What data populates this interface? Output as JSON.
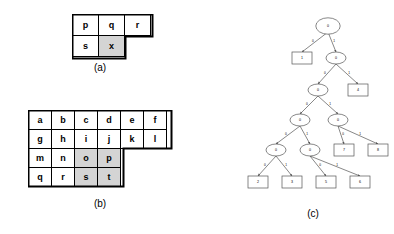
{
  "figures": {
    "a": {
      "caption": "(a)",
      "rows": [
        [
          {
            "label": "p",
            "shaded": false
          },
          {
            "label": "q",
            "shaded": false
          },
          {
            "label": "r",
            "shaded": false
          }
        ],
        [
          {
            "label": "s",
            "shaded": false
          },
          {
            "label": "x",
            "shaded": true
          },
          {
            "label": "",
            "shaded": false,
            "blank": true
          }
        ]
      ]
    },
    "b": {
      "caption": "(b)",
      "rows": [
        [
          {
            "label": "a",
            "shaded": false
          },
          {
            "label": "b",
            "shaded": false
          },
          {
            "label": "c",
            "shaded": false
          },
          {
            "label": "d",
            "shaded": false
          },
          {
            "label": "e",
            "shaded": false
          },
          {
            "label": "f",
            "shaded": false
          }
        ],
        [
          {
            "label": "g",
            "shaded": false
          },
          {
            "label": "h",
            "shaded": false
          },
          {
            "label": "i",
            "shaded": false
          },
          {
            "label": "j",
            "shaded": false
          },
          {
            "label": "k",
            "shaded": false
          },
          {
            "label": "l",
            "shaded": false
          }
        ],
        [
          {
            "label": "m",
            "shaded": false
          },
          {
            "label": "n",
            "shaded": false
          },
          {
            "label": "o",
            "shaded": true
          },
          {
            "label": "p",
            "shaded": true
          },
          {
            "label": "",
            "shaded": false,
            "blank": true
          },
          {
            "label": "",
            "shaded": false,
            "blank": true
          }
        ],
        [
          {
            "label": "q",
            "shaded": false
          },
          {
            "label": "r",
            "shaded": false
          },
          {
            "label": "s",
            "shaded": true
          },
          {
            "label": "t",
            "shaded": true
          },
          {
            "label": "",
            "shaded": false,
            "blank": true
          },
          {
            "label": "",
            "shaded": false,
            "blank": true
          }
        ]
      ]
    },
    "c": {
      "caption": "(c)",
      "nodes": [
        {
          "id": "n0",
          "label": "0",
          "shape": "doubleellipse",
          "x": 96,
          "y": 18
        },
        {
          "id": "n1",
          "label": "1",
          "shape": "rect",
          "x": 70,
          "y": 50
        },
        {
          "id": "n2",
          "label": "0",
          "shape": "ellipse",
          "x": 104,
          "y": 50
        },
        {
          "id": "n3",
          "label": "0",
          "shape": "ellipse",
          "x": 86,
          "y": 82
        },
        {
          "id": "n4",
          "label": "4",
          "shape": "rect",
          "x": 126,
          "y": 82
        },
        {
          "id": "n5",
          "label": "0",
          "shape": "ellipse",
          "x": 68,
          "y": 112
        },
        {
          "id": "n6",
          "label": "0",
          "shape": "ellipse",
          "x": 106,
          "y": 112
        },
        {
          "id": "n7",
          "label": "0",
          "shape": "ellipse",
          "x": 44,
          "y": 142
        },
        {
          "id": "n8",
          "label": "0",
          "shape": "ellipse",
          "x": 78,
          "y": 142
        },
        {
          "id": "n9",
          "label": "7",
          "shape": "rect",
          "x": 112,
          "y": 142
        },
        {
          "id": "n10",
          "label": "8",
          "shape": "rect",
          "x": 146,
          "y": 142
        },
        {
          "id": "n11",
          "label": "2",
          "shape": "rect",
          "x": 26,
          "y": 174
        },
        {
          "id": "n12",
          "label": "3",
          "shape": "rect",
          "x": 60,
          "y": 174
        },
        {
          "id": "n13",
          "label": "5",
          "shape": "rect",
          "x": 94,
          "y": 174
        },
        {
          "id": "n14",
          "label": "6",
          "shape": "rect",
          "x": 128,
          "y": 174
        }
      ],
      "edges": [
        {
          "from": "n0",
          "to": "n1",
          "label": "0"
        },
        {
          "from": "n0",
          "to": "n2",
          "label": "1"
        },
        {
          "from": "n2",
          "to": "n3",
          "label": "0"
        },
        {
          "from": "n2",
          "to": "n4",
          "label": "1"
        },
        {
          "from": "n3",
          "to": "n5",
          "label": "0"
        },
        {
          "from": "n3",
          "to": "n6",
          "label": "1"
        },
        {
          "from": "n5",
          "to": "n7",
          "label": "0"
        },
        {
          "from": "n5",
          "to": "n8",
          "label": "1"
        },
        {
          "from": "n6",
          "to": "n9",
          "label": "0"
        },
        {
          "from": "n6",
          "to": "n10",
          "label": "1"
        },
        {
          "from": "n7",
          "to": "n11",
          "label": "0"
        },
        {
          "from": "n7",
          "to": "n12",
          "label": "1"
        },
        {
          "from": "n8",
          "to": "n13",
          "label": "0"
        },
        {
          "from": "n8",
          "to": "n14",
          "label": "1"
        }
      ]
    }
  },
  "colors": {
    "shaded_cell": "#d4d4d4",
    "grid_line": "#000000",
    "tree_stroke": "#555555",
    "background": "#ffffff"
  }
}
